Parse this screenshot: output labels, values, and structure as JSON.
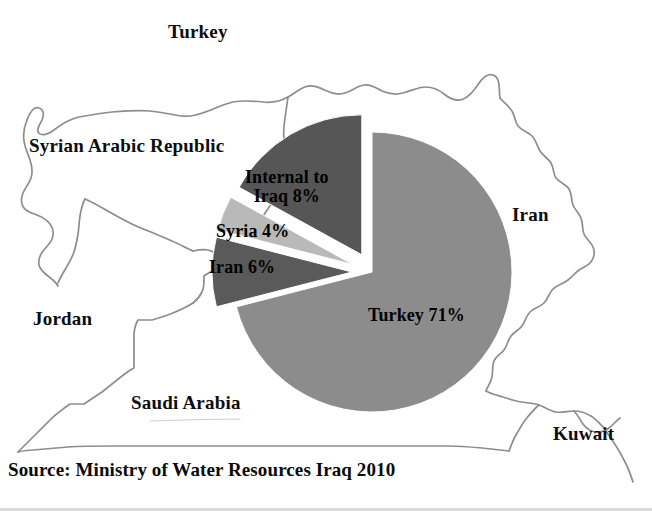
{
  "figure": {
    "width": 652,
    "height": 511,
    "background": "#ffffff",
    "caption": "Source: Ministry of Water Resources Iraq 2010"
  },
  "map": {
    "description": "outline map of Iraq and neighbouring countries",
    "border_color": "#8d8d8d",
    "labels": [
      {
        "name": "turkey",
        "text": "Turkey"
      },
      {
        "name": "syria",
        "text": "Syrian Arabic Republic"
      },
      {
        "name": "iran",
        "text": "Iran"
      },
      {
        "name": "jordan",
        "text": "Jordan"
      },
      {
        "name": "saudi",
        "text": "Saudi Arabia"
      },
      {
        "name": "kuwait",
        "text": "Kuwait"
      }
    ]
  },
  "chart_data": {
    "type": "pie",
    "title": "",
    "subtitle": "",
    "xlabel": "",
    "ylabel": "",
    "legend": "none",
    "grid": false,
    "units": "percent of water resources",
    "total": 89,
    "note": "Slice percentages as printed on the figure; Turkey slice is not exploded, the other three slices are exploded outward.",
    "categories": [
      "Turkey",
      "Internal to Iraq",
      "Syria",
      "Iran"
    ],
    "values": [
      71,
      8,
      4,
      6
    ],
    "labels": [
      "Turkey 71%",
      "Internal to\nIraq 8%",
      "Syria 4%",
      "Iran 6%"
    ],
    "colors": [
      "#8c8c8c",
      "#5a5a5a",
      "#b9b9b9",
      "#565656"
    ],
    "slices": [
      {
        "name": "turkey",
        "label": "Turkey 71%",
        "value": 71,
        "percent": "71%",
        "color": "#8c8c8c",
        "exploded": false,
        "start_angle_deg": 0,
        "end_angle_deg": 255.6
      },
      {
        "name": "internal-to-iraq",
        "label": "Internal to Iraq 8%",
        "value": 8,
        "percent": "8%",
        "color": "#5a5a5a",
        "exploded": true,
        "start_angle_deg": 255.6,
        "end_angle_deg": 284.4
      },
      {
        "name": "syria",
        "label": "Syria 4%",
        "value": 4,
        "percent": "4%",
        "color": "#b9b9b9",
        "exploded": true,
        "start_angle_deg": 284.4,
        "end_angle_deg": 298.8
      },
      {
        "name": "iran",
        "label": "Iran 6%",
        "value": 6,
        "percent": "6%",
        "color": "#565656",
        "exploded": true,
        "start_angle_deg": 298.8,
        "end_angle_deg": 360
      }
    ]
  },
  "slice_labels": {
    "internal": "Internal to\nIraq 8%",
    "syria": "Syria 4%",
    "iran": "Iran 6%",
    "turkey": "Turkey 71%"
  }
}
